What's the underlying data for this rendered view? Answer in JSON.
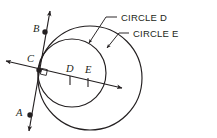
{
  "figure": {
    "kind": "geometry-diagram",
    "stroke_color": "#231f20",
    "background_color": "#ffffff"
  },
  "callouts": [
    {
      "id": "circle-d",
      "label": "CIRCLE D",
      "text_x": 121,
      "text_y": 21,
      "leader": "M 117,17 L 106,17 L 88,44",
      "arrow_x": 88,
      "arrow_y": 44,
      "arrow_angle": 124
    },
    {
      "id": "circle-e",
      "label": "CIRCLE E",
      "text_x": 133,
      "text_y": 37,
      "leader": "M 129,33 L 119,33 L 106,49",
      "arrow_x": 106,
      "arrow_y": 49,
      "arrow_angle": 129
    }
  ],
  "points": [
    {
      "id": "A",
      "label": "A",
      "label_x": 16,
      "label_y": 116,
      "dot_x": 30,
      "dot_y": 115,
      "dot": true
    },
    {
      "id": "B",
      "label": "B",
      "label_x": 33,
      "label_y": 32,
      "dot_x": 45,
      "dot_y": 32,
      "dot": true
    },
    {
      "id": "C",
      "label": "C",
      "label_x": 27,
      "label_y": 62,
      "dot_x": 39,
      "dot_y": 70,
      "dot": true
    },
    {
      "id": "D",
      "label": "D",
      "label_x": 66,
      "label_y": 72,
      "dot_x": 70,
      "dot_y": 80,
      "dot": false
    },
    {
      "id": "E",
      "label": "E",
      "label_x": 85,
      "label_y": 73,
      "dot_x": 88,
      "dot_y": 82,
      "dot": false
    }
  ],
  "circles": [
    {
      "id": "circle-d-shape",
      "center_label": "D",
      "cx": 72,
      "cy": 73,
      "r": 34
    },
    {
      "id": "circle-e-shape",
      "center_label": "E",
      "cx": 90,
      "cy": 78,
      "r": 52
    }
  ],
  "lines": {
    "secant": {
      "id": "secant-line",
      "label": "secant through centers",
      "x1": 6,
      "y1": 61,
      "x2": 122,
      "y2": 88,
      "arrow_start": true,
      "arrow_end": true
    },
    "tangent": {
      "id": "tangent-line",
      "label": "tangent at C",
      "x1": 50,
      "y1": 11,
      "x2": 29,
      "y2": 131,
      "arrow_start": true,
      "arrow_end": true
    }
  },
  "tick_marks": [
    {
      "id": "tick-d",
      "x": 70,
      "y": 80
    },
    {
      "id": "tick-e",
      "x": 88,
      "y": 82
    }
  ],
  "right_angle": {
    "id": "right-angle-marker",
    "x": 39,
    "y": 70,
    "size": 6
  }
}
